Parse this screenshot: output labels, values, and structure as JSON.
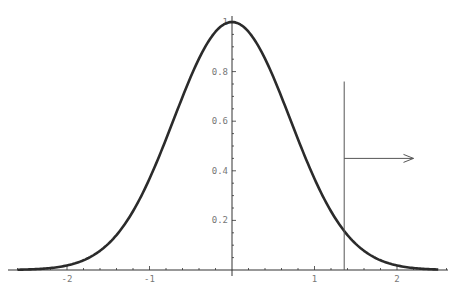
{
  "chart_data": {
    "type": "line",
    "title": "",
    "xlabel": "",
    "ylabel": "",
    "function": "exp(-x^2)",
    "xlim": [
      -2.6,
      2.5
    ],
    "ylim": [
      0,
      1
    ],
    "grid": false,
    "legend": null,
    "x_ticks": [
      -2,
      -1,
      1,
      2
    ],
    "x_tick_labels": [
      "-2",
      "-1",
      "1",
      "2"
    ],
    "y_ticks": [
      0.2,
      0.4,
      0.6,
      0.8,
      1
    ],
    "y_tick_labels": [
      "0.2",
      "0.4",
      "0.6",
      "0.8",
      "1"
    ],
    "series": [
      {
        "name": "curve",
        "x": [
          -2.5,
          -2.0,
          -1.5,
          -1.0,
          -0.5,
          0,
          0.5,
          1.0,
          1.5,
          2.0,
          2.5
        ],
        "values": [
          0.002,
          0.018,
          0.105,
          0.368,
          0.779,
          1.0,
          0.779,
          0.368,
          0.105,
          0.018,
          0.002
        ]
      }
    ],
    "annotations": [
      {
        "type": "vertical-line",
        "x": 1.36,
        "y_top": 0.76
      },
      {
        "type": "arrow",
        "from_x": 1.36,
        "to_x": 2.2,
        "y": 0.45,
        "direction": "right"
      }
    ]
  },
  "colors": {
    "curve": "#2b2b2b",
    "axis": "#333333",
    "annotation": "#555555",
    "tick_label": "#777777"
  }
}
